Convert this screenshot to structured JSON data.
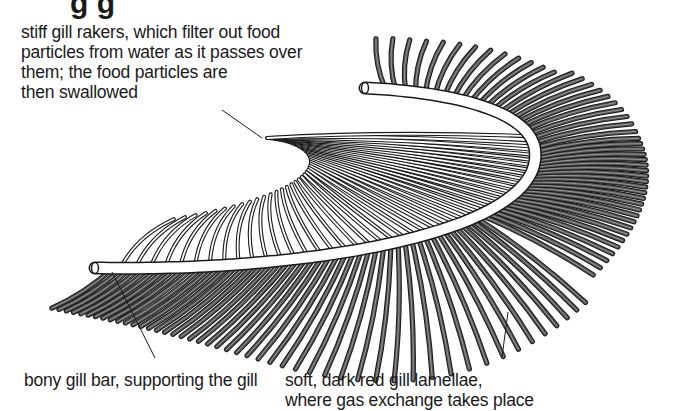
{
  "heading": {
    "text": "g  g",
    "note": "cropped at top edge; only descenders visible"
  },
  "labels": {
    "rakers": {
      "lines": [
        "stiff gill rakers, which filter out food",
        "particles from water as it passes over",
        "them; the food particles are",
        "then swallowed"
      ]
    },
    "bar": {
      "lines": [
        "bony gill bar, supporting the gill"
      ]
    },
    "lamellae": {
      "lines": [
        "soft, dark red gill lamellae,",
        "where gas exchange takes place"
      ]
    }
  },
  "colors": {
    "background": "#ffffff",
    "ink": "#1a1a1a",
    "lamellae_fill": "#555555",
    "raker_fill": "#ffffff",
    "bar_fill": "#ffffff"
  },
  "parts": [
    "gill-rakers",
    "gill-bar",
    "gill-lamellae"
  ]
}
